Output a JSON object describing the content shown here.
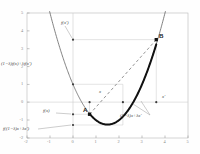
{
  "chart_data": {
    "type": "line",
    "title": "",
    "xlabel": "",
    "ylabel": "",
    "xlim": [
      -2,
      5
    ],
    "ylim": [
      -2,
      5
    ],
    "grid": true,
    "legend": null,
    "function": "f(x) = x^2 - 3x + 1",
    "xticks": [
      "-2",
      "-1",
      "0",
      "1",
      "2",
      "3",
      "4",
      "5"
    ],
    "xtick_values": [
      -2,
      -1,
      0,
      1,
      2,
      3,
      4,
      5
    ],
    "yticks": [
      "-2",
      "-1",
      "0",
      "1",
      "2",
      "3",
      "4",
      "5"
    ],
    "ytick_values": [
      -2,
      -1,
      0,
      1,
      2,
      3,
      4,
      5
    ],
    "curve_color": "#6b6b6b",
    "bold_segment_color": "#111111",
    "chord_color": "#8a8a8a",
    "guide_color": "#c8c8c8",
    "points": [
      {
        "name": "A",
        "label": "A",
        "x": 0.72,
        "y": -0.68
      },
      {
        "name": "B",
        "label": "B",
        "x": 3.62,
        "y": 3.22
      }
    ],
    "bold_segment": {
      "x_start": 0.72,
      "x_end": 3.62
    },
    "chord": {
      "x1": 0.72,
      "y1": -0.68,
      "x2": 3.62,
      "y2": 3.22
    },
    "markers": [
      {
        "x": 0.0,
        "y": 3.5
      },
      {
        "x": 0.0,
        "y": 1.0
      },
      {
        "x": 0.0,
        "y": -0.68
      },
      {
        "x": 0.0,
        "y": -1.28
      },
      {
        "x": 0.72,
        "y": 0.0
      },
      {
        "x": 2.17,
        "y": 0.0
      },
      {
        "x": 3.62,
        "y": 0.0
      }
    ],
    "hlines": [
      {
        "y": 3.5,
        "x_from": 0.0,
        "x_to": 3.62
      },
      {
        "y": 1.0,
        "x_from": 0.0,
        "x_to": 2.17
      },
      {
        "y": -0.68,
        "x_from": 0.0,
        "x_to": 0.72
      },
      {
        "y": -1.28,
        "x_from": 0.0,
        "x_to": 2.17
      }
    ],
    "vlines": [
      {
        "x": 0.72,
        "y_from": -0.68,
        "y_to": 0.0
      },
      {
        "x": 2.17,
        "y_from": -1.28,
        "y_to": 1.0
      },
      {
        "x": 3.62,
        "y_from": 0.0,
        "y_to": 3.5
      }
    ]
  },
  "annotations": {
    "f_xprime": "f(x′)",
    "convex_combination_of_values": "(1−λ)f(x)+λf(x′)",
    "f_x": "f(x)",
    "f_of_convex_combination": "f((1−λ)x+λx′)",
    "x_point": "x",
    "x_prime_point": "x′",
    "convex_combination_of_points": "(1−λ)x+λx′",
    "point_a": "A",
    "point_b": "B"
  }
}
